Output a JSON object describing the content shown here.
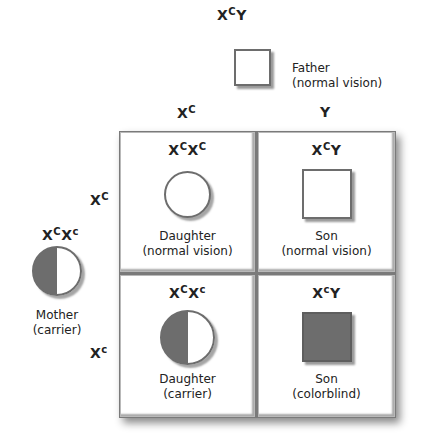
{
  "father": {
    "genotype_base1": "X",
    "genotype_sup1": "C",
    "genotype_base2": "Y",
    "label_line1": "Father",
    "label_line2": "(normal vision)",
    "symbol": "square-open"
  },
  "mother": {
    "genotype_base1": "X",
    "genotype_sup1": "C",
    "genotype_base2": "X",
    "genotype_sup2": "c",
    "label_line1": "Mother",
    "label_line2": "(carrier)",
    "symbol": "circle-half-filled"
  },
  "column_headers": [
    {
      "base": "X",
      "sup": "C"
    },
    {
      "base": "Y",
      "sup": ""
    }
  ],
  "row_headers": [
    {
      "base": "X",
      "sup": "C"
    },
    {
      "base": "X",
      "sup": "c"
    }
  ],
  "cells": [
    {
      "g1": "X",
      "s1": "C",
      "g2": "X",
      "s2": "C",
      "symbol": "circle-open",
      "label_line1": "Daughter",
      "label_line2": "(normal vision)"
    },
    {
      "g1": "X",
      "s1": "C",
      "g2": "Y",
      "s2": "",
      "symbol": "square-open",
      "label_line1": "Son",
      "label_line2": "(normal vision)"
    },
    {
      "g1": "X",
      "s1": "C",
      "g2": "X",
      "s2": "c",
      "symbol": "circle-half-filled",
      "label_line1": "Daughter",
      "label_line2": "(carrier)"
    },
    {
      "g1": "X",
      "s1": "c",
      "g2": "Y",
      "s2": "",
      "symbol": "square-filled",
      "label_line1": "Son",
      "label_line2": "(colorblind)"
    }
  ],
  "colors": {
    "filled": "#6d6d6d",
    "outline": "#6d6d6d",
    "background": "#ffffff"
  }
}
